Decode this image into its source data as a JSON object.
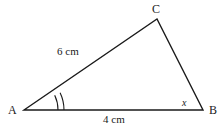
{
  "figure": {
    "type": "triangle-diagram",
    "background_color": "#ffffff",
    "stroke_color": "#1a1a1a",
    "text_color": "#1a1a1a",
    "vertices": [
      {
        "name": "A",
        "label": "A",
        "x": 24,
        "y": 110
      },
      {
        "name": "B",
        "label": "B",
        "x": 203,
        "y": 110
      },
      {
        "name": "C",
        "label": "C",
        "x": 157,
        "y": 19
      }
    ],
    "sides": [
      {
        "name": "AC",
        "label": "6 cm",
        "length": 6,
        "unit": "cm"
      },
      {
        "name": "AB",
        "label": "4 cm",
        "length": 4,
        "unit": "cm"
      },
      {
        "name": "BC",
        "label": "",
        "length": null,
        "unit": ""
      }
    ],
    "angles": [
      {
        "vertex": "A",
        "marker": "double-arc",
        "label": ""
      },
      {
        "vertex": "B",
        "marker": "none",
        "label": "x"
      }
    ],
    "path": "M24,110 L157,19 L203,110 Z"
  }
}
